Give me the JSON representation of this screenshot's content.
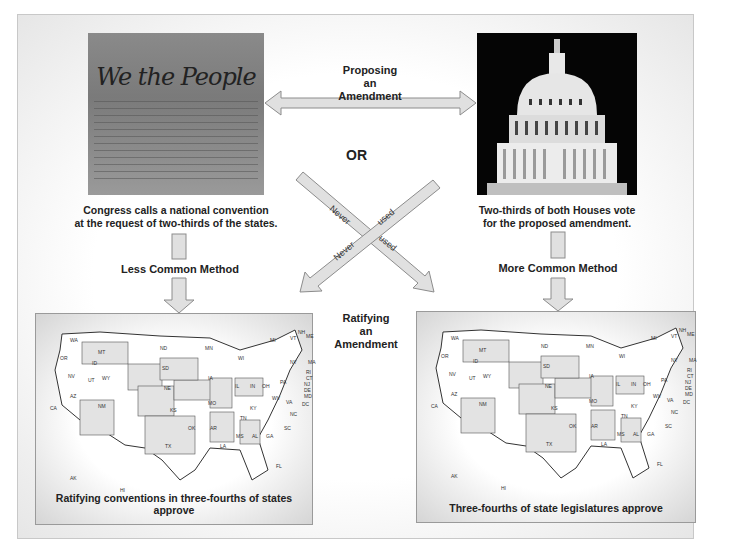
{
  "diagram": {
    "proposing_label": [
      "Proposing",
      "an",
      "Amendment"
    ],
    "ratifying_label": [
      "Ratifying",
      "an",
      "Amendment"
    ],
    "or_label": "OR",
    "left_photo": {
      "title_text": "We the People",
      "alt": "Constitution preamble document"
    },
    "right_photo": {
      "alt": "U.S. Capitol dome at night"
    },
    "left_caption": [
      "Congress calls a national convention",
      "at the request of two-thirds of the states."
    ],
    "right_caption": [
      "Two-thirds of both Houses vote",
      "for the proposed amendment."
    ],
    "left_method": "Less Common Method",
    "right_method": "More Common Method",
    "cross_arrows": {
      "word1": "Never",
      "word2": "used"
    },
    "left_map_caption": "Ratifying conventions in three-fourths of states approve",
    "right_map_caption": "Three-fourths of state legislatures approve",
    "state_labels": [
      "WA",
      "OR",
      "CA",
      "NV",
      "ID",
      "MT",
      "WY",
      "UT",
      "AZ",
      "CO",
      "NM",
      "ND",
      "SD",
      "NE",
      "KS",
      "OK",
      "TX",
      "MN",
      "IA",
      "MO",
      "AR",
      "LA",
      "WI",
      "IL",
      "MI",
      "IN",
      "OH",
      "KY",
      "TN",
      "MS",
      "AL",
      "GA",
      "FL",
      "SC",
      "NC",
      "VA",
      "WV",
      "PA",
      "NY",
      "VT",
      "NH",
      "ME",
      "MA",
      "RI",
      "CT",
      "NJ",
      "DE",
      "MD",
      "DC",
      "AK",
      "HI"
    ],
    "colors": {
      "arrow_fill": "#e0e0e0",
      "arrow_stroke": "#8c8c8c",
      "shaded_state": "#e3e3e3",
      "panel_border": "#c8c8c8"
    }
  }
}
